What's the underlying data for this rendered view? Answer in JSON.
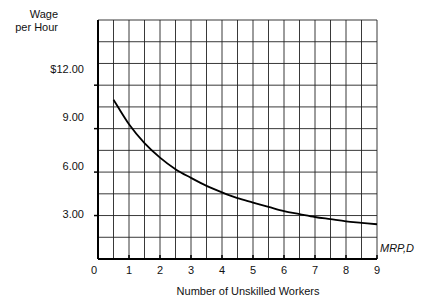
{
  "chart_data": {
    "type": "line",
    "title": "",
    "xlabel": "Number of Unskilled Workers",
    "ylabel": "Wage per Hour",
    "ylabel_lines": [
      "Wage",
      "per Hour"
    ],
    "x_ticks": [
      "0",
      "1",
      "2",
      "3",
      "4",
      "5",
      "6",
      "7",
      "8",
      "9"
    ],
    "y_ticks": [
      {
        "value": 3,
        "label": "3.00"
      },
      {
        "value": 6,
        "label": "6.00"
      },
      {
        "value": 9,
        "label": "9.00"
      },
      {
        "value": 12,
        "label": "$12.00"
      }
    ],
    "xlim": [
      0,
      9
    ],
    "ylim": [
      0,
      16.5
    ],
    "grid": true,
    "grid_x_step": 0.5,
    "grid_y_step": 1.5,
    "series": [
      {
        "name": "MRP,D",
        "x": [
          0.5,
          1,
          1.5,
          2,
          2.5,
          3,
          3.5,
          4,
          4.5,
          5,
          5.5,
          6,
          6.5,
          7,
          7.5,
          8,
          8.5,
          9
        ],
        "values": [
          11.0,
          9.3,
          8.0,
          7.0,
          6.2,
          5.6,
          5.05,
          4.6,
          4.2,
          3.9,
          3.6,
          3.3,
          3.1,
          2.9,
          2.75,
          2.6,
          2.5,
          2.4
        ]
      }
    ]
  }
}
